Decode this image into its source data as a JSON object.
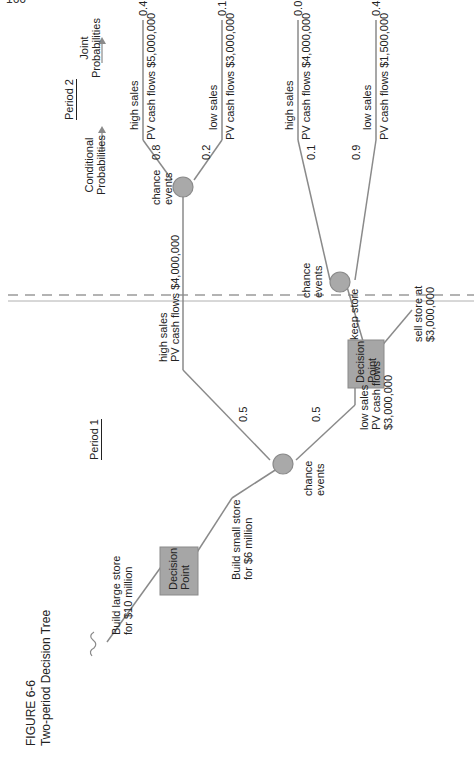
{
  "page": {
    "number": "166"
  },
  "figure": {
    "label": "FIGURE 6-6",
    "title": "Two-period Decision Tree"
  },
  "periods": {
    "period1": "Period 1",
    "period2": "Period 2"
  },
  "headers": {
    "conditional": [
      "Conditional",
      "Probabilities"
    ],
    "joint": [
      "Joint",
      "Probabilities"
    ]
  },
  "decision_points": {
    "root": [
      "Decision",
      "Point"
    ],
    "second": [
      "Decision",
      "Point"
    ]
  },
  "chance_nodes": {
    "period1": [
      "chance",
      "events"
    ],
    "upper": [
      "chance",
      "events"
    ],
    "lower": [
      "chance",
      "events"
    ]
  },
  "root_branches": {
    "large": [
      "Build large store",
      "for $10 million"
    ],
    "small": [
      "Build small store",
      "for $6 million"
    ]
  },
  "period1_branches": {
    "high": {
      "label": [
        "high sales",
        "PV cash flows $4,000,000"
      ],
      "probability": "0.5"
    },
    "low": {
      "label": [
        "low sales",
        "PV cash flows",
        "$3,000,000"
      ],
      "probability": "0.5"
    }
  },
  "second_decision_branches": {
    "keep": "keep store",
    "sell": [
      "sell store at",
      "$3,000,000"
    ]
  },
  "outcomes": [
    {
      "event": "high sales",
      "cash": "PV cash flows   $5,000,000",
      "conditional": "0.8",
      "joint": "0.4"
    },
    {
      "event": "low sales",
      "cash": "PV cash flows   $3,000,000",
      "conditional": "0.2",
      "joint": "0.1"
    },
    {
      "event": "high sales",
      "cash": "PV cash flows   $4,000,000",
      "conditional": "0.1",
      "joint": "0.05"
    },
    {
      "event": "low sales",
      "cash": "PV cash flows   $1,500,000",
      "conditional": "0.9",
      "joint": "0.45"
    }
  ],
  "colors": {
    "line": "#8a8a8a",
    "node_fill": "#a9a9a9",
    "box_fill": "#a6a6a6",
    "dash": "#9a9a9a",
    "text": "#222222"
  }
}
